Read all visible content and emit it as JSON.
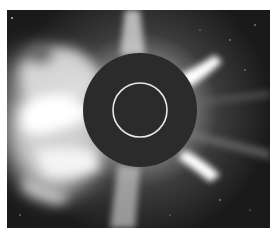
{
  "image": {
    "subject": "coronagraph view of the solar corona with a coronal mass ejection",
    "colors": {
      "background": "#1a1a1a",
      "occulter": "#2b2b2b",
      "corona": "#f2f2f2",
      "sun_outline": "#e8e8e8"
    },
    "elements": [
      {
        "name": "occulting-disk",
        "cx": 140,
        "cy": 110,
        "r": 57
      },
      {
        "name": "sun-outline-circle",
        "cx": 140,
        "cy": 110,
        "r": 27
      },
      {
        "name": "cme-cloud",
        "position": "left"
      },
      {
        "name": "coronal-streamers",
        "positions": [
          "top",
          "upper-right",
          "lower-right",
          "bottom"
        ]
      }
    ]
  }
}
